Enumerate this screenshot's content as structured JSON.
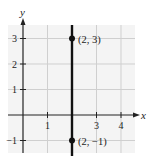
{
  "chart_data": {
    "type": "line",
    "title": "",
    "xlabel": "x",
    "ylabel": "y",
    "xlim": [
      -0.6,
      4.6
    ],
    "ylim": [
      -1.5,
      3.5
    ],
    "grid": true,
    "x_ticks": [
      1,
      3,
      4
    ],
    "x_tick_labels": [
      "1",
      "3",
      "4"
    ],
    "y_ticks": [
      -1,
      1,
      2,
      3
    ],
    "y_tick_labels": [
      "−1",
      "1",
      "2",
      "3"
    ],
    "series": [
      {
        "name": "vertical line x = 2",
        "kind": "vertical-line",
        "x": 2
      }
    ],
    "points": [
      {
        "x": 2,
        "y": 3,
        "label": "(2, 3)"
      },
      {
        "x": 2,
        "y": -1,
        "label": "(2, −1)"
      }
    ]
  },
  "colors": {
    "grid": "#cfcfcf",
    "axis": "#222222",
    "line": "#111111",
    "point": "#111111",
    "background": "#f4f4f4"
  }
}
